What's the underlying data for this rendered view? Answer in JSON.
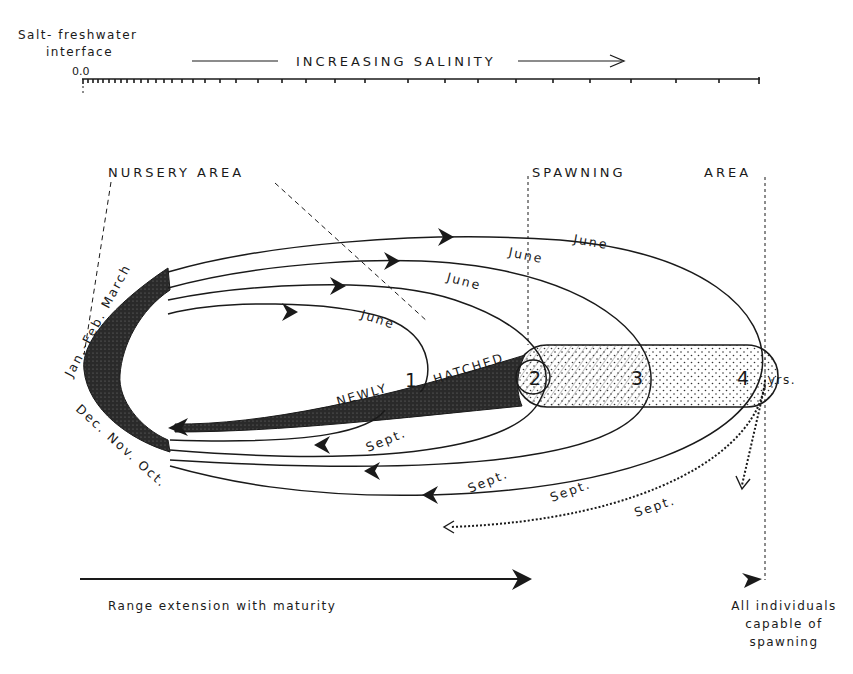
{
  "scale": {
    "origin_label_line1": "Salt- freshwater",
    "origin_label_line2": "interface",
    "origin_value": "0.0",
    "axis_title": "INCREASING  SALINITY"
  },
  "areas": {
    "nursery": "NURSERY  AREA",
    "spawning": "SPAWNING",
    "spawning_area": "AREA"
  },
  "loops": {
    "winter_upper": "Jan.-Feb. March",
    "winter_lower": "Dec. Nov. Oct.",
    "june_1": "June",
    "june_2": "June",
    "june_3": "June",
    "june_4": "June",
    "sept_1": "Sept.",
    "sept_2": "Sept.",
    "sept_3": "Sept.",
    "sept_4": "Sept."
  },
  "ages": {
    "age_1": "1",
    "age_2": "2",
    "age_3": "3",
    "age_4": "4",
    "unit": "yrs."
  },
  "newly_hatched": {
    "word1": "NEWLY",
    "word2": "HATCHED"
  },
  "footer": {
    "range_label": "Range  extension  with  maturity",
    "spawn_line1": "All individuals",
    "spawn_line2": "capable of",
    "spawn_line3": "spawning"
  },
  "colors": {
    "ink": "#1a1a1a",
    "background": "#ffffff"
  }
}
